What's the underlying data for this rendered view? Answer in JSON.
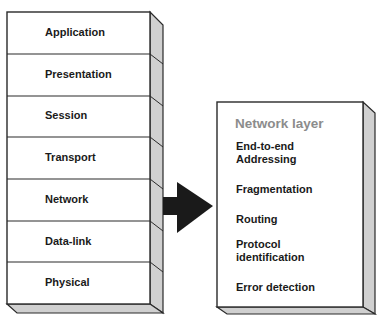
{
  "osi_stack": {
    "layers": [
      {
        "label": "Application"
      },
      {
        "label": "Presentation"
      },
      {
        "label": "Session"
      },
      {
        "label": "Transport"
      },
      {
        "label": "Network"
      },
      {
        "label": "Data-link"
      },
      {
        "label": "Physical"
      }
    ]
  },
  "detail_box": {
    "title": "Network layer",
    "items": [
      {
        "label": "End-to-end\nAddressing"
      },
      {
        "label": "Fragmentation"
      },
      {
        "label": "Routing"
      },
      {
        "label": "Protocol\nidentification"
      },
      {
        "label": "Error detection"
      }
    ]
  },
  "colors": {
    "face": "#ffffff",
    "side": "#d0d0d0",
    "stroke": "#2a2a2a",
    "arrow": "#1a1a1a",
    "title": "#8c8c8c"
  }
}
